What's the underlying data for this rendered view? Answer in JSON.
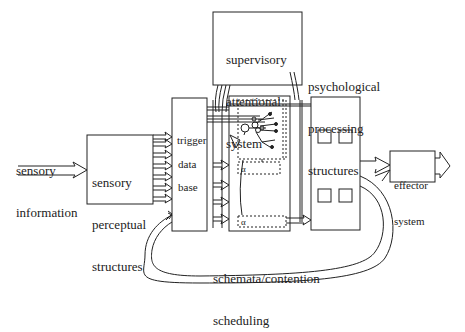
{
  "diagram": {
    "type": "block-diagram",
    "title": "",
    "nodes": {
      "supervisory": {
        "lines": [
          "supervisory",
          "attentional",
          "system"
        ]
      },
      "psych": {
        "lines": [
          "psychological",
          "processing",
          "structures"
        ]
      },
      "sensory_input": {
        "lines": [
          "sensory",
          "information"
        ]
      },
      "sensory_perceptual": {
        "lines": [
          "sensory",
          "perceptual",
          "structures"
        ]
      },
      "trigger_db": {
        "lines": [
          "trigger",
          "data",
          "base"
        ]
      },
      "schemata": {
        "lines": [
          "schemata/contention",
          "scheduling"
        ]
      },
      "effector": {
        "lines": [
          "effector",
          "system"
        ]
      },
      "schema_unit_label": "α"
    },
    "edges": [
      {
        "from": "sensory_input",
        "to": "sensory_perceptual",
        "style": "hollow-arrow"
      },
      {
        "from": "sensory_perceptual",
        "to": "trigger_db",
        "style": "hollow-arrow",
        "count": 6
      },
      {
        "from": "trigger_db",
        "to": "schemata",
        "style": "hollow-arrow",
        "count": 5
      },
      {
        "from": "supervisory",
        "to": "schemata",
        "style": "lines"
      },
      {
        "from": "supervisory",
        "to": "psych",
        "style": "lines"
      },
      {
        "from": "schemata",
        "to": "psych",
        "style": "hollow-arrow"
      },
      {
        "from": "psych",
        "to": "effector",
        "style": "hollow-arrow"
      },
      {
        "from": "effector",
        "to": "output",
        "style": "hollow-arrow"
      },
      {
        "from": "psych",
        "to": "trigger_db",
        "style": "feedback-loop"
      },
      {
        "from": "psych",
        "to": "effector",
        "style": "feedback-loop"
      }
    ]
  },
  "colors": {
    "ink": "#222222",
    "background": "#ffffff"
  }
}
